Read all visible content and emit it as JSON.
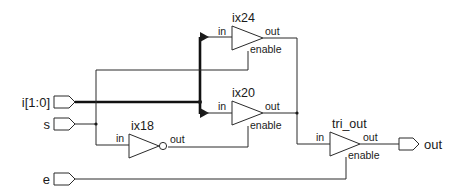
{
  "diagram": {
    "type": "gate-level schematic",
    "inputs": [
      {
        "name": "i[1:0]",
        "label": "i[1:0]",
        "bus": true
      },
      {
        "name": "s",
        "label": "s"
      },
      {
        "name": "e",
        "label": "e"
      }
    ],
    "outputs": [
      {
        "name": "out",
        "label": "out"
      }
    ],
    "instances": [
      {
        "id": "ix24",
        "label": "ix24",
        "kind": "tristate-buffer",
        "pins": {
          "in": "in",
          "out": "out",
          "enable": "enable"
        }
      },
      {
        "id": "ix20",
        "label": "ix20",
        "kind": "tristate-buffer",
        "pins": {
          "in": "in",
          "out": "out",
          "enable": "enable"
        }
      },
      {
        "id": "ix18",
        "label": "ix18",
        "kind": "inverter",
        "pins": {
          "in": "in",
          "out": "out"
        }
      },
      {
        "id": "tri_out",
        "label": "tri_out",
        "kind": "tristate-buffer",
        "pins": {
          "in": "in",
          "out": "out",
          "enable": "enable"
        }
      }
    ],
    "nets": [
      {
        "from": "i[1:0]",
        "to": [
          "ix24.in",
          "ix20.in"
        ]
      },
      {
        "from": "s",
        "to": [
          "ix24.enable",
          "ix18.in"
        ]
      },
      {
        "from": "ix18.out",
        "to": [
          "ix20.enable"
        ]
      },
      {
        "from": "ix24.out",
        "to": [
          "tri_out.in"
        ]
      },
      {
        "from": "ix20.out",
        "to": [
          "tri_out.in"
        ]
      },
      {
        "from": "e",
        "to": [
          "tri_out.enable"
        ]
      },
      {
        "from": "tri_out.out",
        "to": [
          "out"
        ]
      }
    ]
  }
}
